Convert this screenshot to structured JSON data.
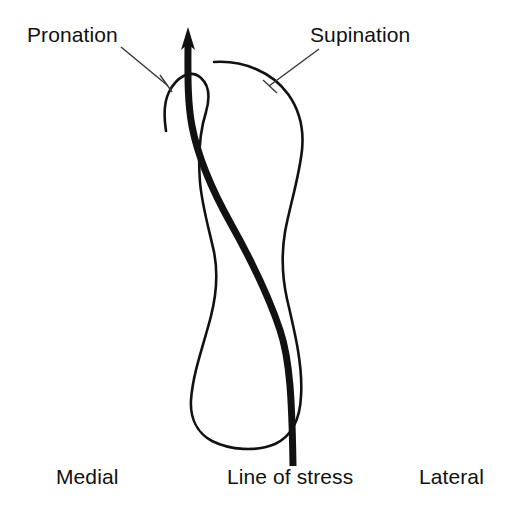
{
  "figure": {
    "kind": "anatomical-line-drawing",
    "background_color": "#ffffff",
    "ink_color": "#111111",
    "leader_line_color": "#3a3a3a"
  },
  "labels": {
    "pronation": "Pronation",
    "supination": "Supination",
    "medial": "Medial",
    "line_of_stress": "Line of stress",
    "lateral": "Lateral"
  },
  "annotations": {
    "pronation_leader": {
      "from_x": 121,
      "from_y": 47,
      "to_x": 167,
      "to_y": 85
    },
    "supination_leader": {
      "from_x": 319,
      "from_y": 49,
      "to_x": 269,
      "to_y": 86
    }
  },
  "graphics": {
    "bone_outline_path": "M 214 62 C 243 60 272 72 288 94 C 301 112 304 130 302 150 C 299 178 290 205 285 232 C 281 256 282 276 287 299 C 295 333 303 366 301 396 C 300 420 292 436 275 444 C 256 452 230 450 212 441 C 197 433 190 418 191 400 C 193 372 204 344 211 316 C 217 292 218 272 214 252 C 209 229 202 206 200 182 C 198 156 200 131 206 112 C 210 98 210 86 201 78 C 190 68 176 78 169 92 C 163 104 164 118 166 131",
    "stress_line_path": "M 188 40 C 188 70 187 100 192 126 C 198 158 212 190 231 224 C 250 258 268 294 280 330 C 290 360 292 400 293 466",
    "arrow_tip": {
      "x": 188,
      "y": 27
    },
    "arrow_base": {
      "x": 188,
      "y": 48
    },
    "arrow_half_width": 7,
    "stress_line_width": 7,
    "outline_width": 2.6
  }
}
